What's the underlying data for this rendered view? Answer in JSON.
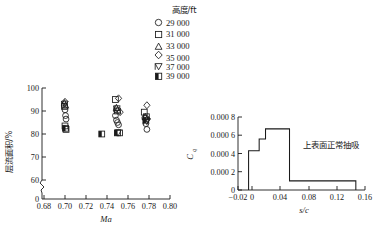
{
  "legend": {
    "title": "高度/ft",
    "items": [
      {
        "marker": "circle",
        "label": "29 000"
      },
      {
        "marker": "square",
        "label": "31 000"
      },
      {
        "marker": "triangle",
        "label": "33 000"
      },
      {
        "marker": "diamond",
        "label": "35 000"
      },
      {
        "marker": "down-triangle-flag",
        "label": "37 000"
      },
      {
        "marker": "half-filled-square",
        "label": "39 000"
      }
    ]
  },
  "chart_data": [
    {
      "id": "laminar-area-vs-mach",
      "type": "scatter",
      "title": "",
      "xlabel": "Ma",
      "ylabel": "层流面积/%",
      "xlim": [
        0.68,
        0.8
      ],
      "ylim": [
        0,
        100
      ],
      "xticks": [
        "0.68",
        "0.70",
        "0.72",
        "0.74",
        "0.76",
        "0.78",
        "0.80"
      ],
      "yticks": [
        "0",
        "60",
        "70",
        "80",
        "90",
        "100"
      ],
      "axis_break_y": true,
      "axis_break_x": true,
      "grid": false,
      "legend_position": "top-center",
      "series": [
        {
          "name": "29 000",
          "marker": "circle",
          "x": [
            0.7,
            0.7005,
            0.701,
            0.748,
            0.749,
            0.75,
            0.751,
            0.776,
            0.777,
            0.778
          ],
          "y": [
            90.5,
            88.0,
            86.5,
            88.0,
            86.0,
            85.0,
            84.0,
            87.0,
            84.5,
            82.0
          ]
        },
        {
          "name": "31 000",
          "marker": "square",
          "x": [
            0.6995,
            0.7,
            0.701,
            0.748,
            0.75,
            0.752,
            0.7755,
            0.7775
          ],
          "y": [
            92.0,
            83.5,
            82.0,
            95.0,
            90.0,
            80.5,
            89.5,
            87.5
          ]
        },
        {
          "name": "33 000",
          "marker": "triangle",
          "x": [
            0.6995,
            0.7005,
            0.749,
            0.75,
            0.7765
          ],
          "y": [
            93.5,
            92.5,
            91.5,
            90.5,
            87.5
          ]
        },
        {
          "name": "35 000",
          "marker": "diamond",
          "x": [
            0.7,
            0.751,
            0.7525,
            0.778,
            0.7785
          ],
          "y": [
            94.0,
            95.5,
            89.5,
            92.5,
            86.5
          ]
        },
        {
          "name": "37 000",
          "marker": "down-triangle-flag",
          "x": [
            0.6998,
            0.7495,
            0.7505,
            0.778
          ],
          "y": [
            93.0,
            91.0,
            80.5,
            85.5
          ]
        },
        {
          "name": "39 000",
          "marker": "half-filled-square",
          "x": [
            0.7005,
            0.735,
            0.75,
            0.777
          ],
          "y": [
            82.5,
            80.0,
            80.5,
            86.0
          ]
        }
      ]
    },
    {
      "id": "suction-coefficient-distribution",
      "type": "line",
      "title": "",
      "xlabel": "s/c",
      "ylabel": "Cq",
      "ylabel_base": "C",
      "ylabel_sub": "q",
      "xlim": [
        -0.02,
        0.16
      ],
      "ylim": [
        0,
        0.0008
      ],
      "xticks": [
        "−0.02",
        "0",
        "0.04",
        "0.08",
        "0.12",
        "0.16"
      ],
      "yticks": [
        "0",
        "0.000 2",
        "0.000 4",
        "0.000 6",
        "0.000 8"
      ],
      "grid": false,
      "annotation": "上表面正常抽吸",
      "step_points": [
        {
          "x": -0.005,
          "y": 0.0
        },
        {
          "x": -0.005,
          "y": 0.00043
        },
        {
          "x": 0.01,
          "y": 0.00043
        },
        {
          "x": 0.01,
          "y": 0.00056
        },
        {
          "x": 0.019,
          "y": 0.00056
        },
        {
          "x": 0.019,
          "y": 0.00067
        },
        {
          "x": 0.053,
          "y": 0.00067
        },
        {
          "x": 0.053,
          "y": 0.0001
        },
        {
          "x": 0.147,
          "y": 0.0001
        },
        {
          "x": 0.147,
          "y": 0.0
        }
      ]
    }
  ]
}
